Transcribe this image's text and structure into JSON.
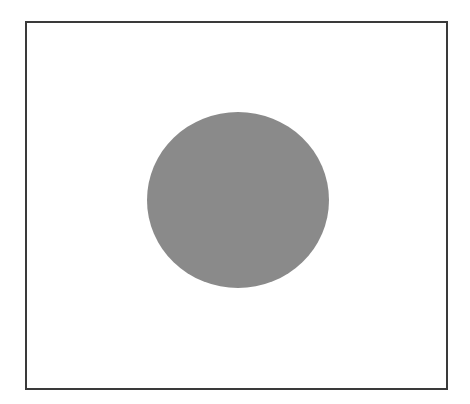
{
  "diagram": {
    "frame": {
      "x": 26,
      "y": 22,
      "width": 421,
      "height": 367,
      "stroke": "#3a3a3a",
      "stroke_width": 2,
      "fill": "#ffffff"
    },
    "ellipse": {
      "cx": 238,
      "cy": 200,
      "rx": 91,
      "ry": 88,
      "fill": "#8a8a8a"
    }
  }
}
